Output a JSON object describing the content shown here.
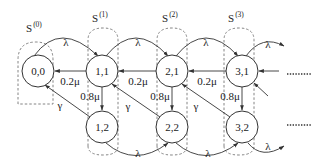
{
  "diagram": {
    "type": "state-transition-diagram",
    "nodes": [
      {
        "id": "n00",
        "label": "0,0"
      },
      {
        "id": "n11",
        "label": "1,1"
      },
      {
        "id": "n21",
        "label": "2,1"
      },
      {
        "id": "n31",
        "label": "3,1"
      },
      {
        "id": "n12",
        "label": "1,2"
      },
      {
        "id": "n22",
        "label": "2,2"
      },
      {
        "id": "n32",
        "label": "3,2"
      }
    ],
    "groups": [
      {
        "id": "g0",
        "label": "S",
        "superscript": "(0)",
        "members": [
          "n00"
        ]
      },
      {
        "id": "g1",
        "label": "S",
        "superscript": "(1)",
        "members": [
          "n11",
          "n12"
        ]
      },
      {
        "id": "g2",
        "label": "S",
        "superscript": "(2)",
        "members": [
          "n21",
          "n22"
        ]
      },
      {
        "id": "g3",
        "label": "S",
        "superscript": "(3)",
        "members": [
          "n31",
          "n32"
        ]
      }
    ],
    "edges": [
      {
        "from": "n00",
        "to": "n11",
        "label": "λ"
      },
      {
        "from": "n11",
        "to": "n21",
        "label": "λ"
      },
      {
        "from": "n21",
        "to": "n31",
        "label": "λ"
      },
      {
        "from": "n31",
        "to": "next-row1",
        "label": "λ"
      },
      {
        "from": "n11",
        "to": "n00",
        "label": "0.2μ"
      },
      {
        "from": "n21",
        "to": "n11",
        "label": "0.2μ"
      },
      {
        "from": "n31",
        "to": "n21",
        "label": "0.2μ"
      },
      {
        "from": "n11",
        "to": "n12",
        "label": "0.8μ"
      },
      {
        "from": "n21",
        "to": "n22",
        "label": "0.8μ"
      },
      {
        "from": "n31",
        "to": "n32",
        "label": "0.8μ"
      },
      {
        "from": "n12",
        "to": "n00",
        "label": "γ"
      },
      {
        "from": "n22",
        "to": "n11",
        "label": "γ"
      },
      {
        "from": "n32",
        "to": "n21",
        "label": "γ"
      },
      {
        "from": "n12",
        "to": "n22",
        "label": "λ"
      },
      {
        "from": "n22",
        "to": "n32",
        "label": "λ"
      },
      {
        "from": "n32",
        "to": "next-row2",
        "label": "λ"
      }
    ],
    "continuation": "......."
  }
}
